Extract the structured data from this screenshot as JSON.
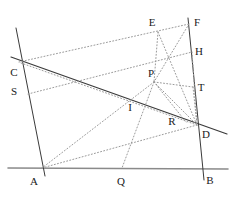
{
  "figure": {
    "width": 230,
    "height": 198,
    "colors": {
      "solid_line": "#3a3a3a",
      "baseline": "#8a8a8a",
      "dotted_line": "#9a9a9a",
      "label": "#1a1a1a",
      "background": "#ffffff"
    },
    "points": [
      {
        "id": "A",
        "label": "A",
        "x": 41,
        "y": 168,
        "label_x": 34,
        "label_y": 181
      },
      {
        "id": "B",
        "label": "B",
        "x": 201,
        "y": 168,
        "label_x": 210,
        "label_y": 180
      },
      {
        "id": "C",
        "label": "C",
        "x": 21,
        "y": 63,
        "label_x": 14,
        "label_y": 72
      },
      {
        "id": "D",
        "label": "D",
        "x": 197,
        "y": 125,
        "label_x": 206,
        "label_y": 134
      },
      {
        "id": "E",
        "label": "E",
        "x": 158,
        "y": 32,
        "label_x": 152,
        "label_y": 22
      },
      {
        "id": "F",
        "label": "F",
        "x": 189,
        "y": 24,
        "label_x": 197,
        "label_y": 22
      },
      {
        "id": "H",
        "label": "H",
        "x": 192,
        "y": 52,
        "label_x": 199,
        "label_y": 51
      },
      {
        "id": "I",
        "label": "I",
        "x": 127,
        "y": 101,
        "label_x": 130,
        "label_y": 107
      },
      {
        "id": "P",
        "label": "P",
        "x": 154,
        "y": 82,
        "label_x": 151,
        "label_y": 73
      },
      {
        "id": "Q",
        "label": "Q",
        "x": 122,
        "y": 168,
        "label_x": 121,
        "label_y": 181
      },
      {
        "id": "R",
        "label": "R",
        "x": 178,
        "y": 115,
        "label_x": 172,
        "label_y": 121
      },
      {
        "id": "S",
        "label": "S",
        "x": 28,
        "y": 94,
        "label_x": 14,
        "label_y": 91
      },
      {
        "id": "T",
        "label": "T",
        "x": 193,
        "y": 87,
        "label_x": 201,
        "label_y": 87
      }
    ],
    "segments": [
      {
        "name": "baseline-AB",
        "from": [
          8,
          168
        ],
        "to": [
          228,
          169
        ],
        "style": "solid-gray",
        "width": 1.6
      },
      {
        "name": "left-line-CA",
        "from": [
          16,
          28
        ],
        "to": [
          45,
          176
        ],
        "style": "solid-dark",
        "width": 1.0
      },
      {
        "name": "right-line-FB",
        "from": [
          188,
          18
        ],
        "to": [
          204,
          180
        ],
        "style": "solid-dark",
        "width": 1.0
      },
      {
        "name": "transversal-CD",
        "from": [
          11,
          57
        ],
        "to": [
          227,
          134
        ],
        "style": "solid-dark",
        "width": 1.2
      },
      {
        "name": "dotted-C-E-F",
        "from": [
          19,
          62
        ],
        "to": [
          189,
          24
        ],
        "style": "dotted",
        "width": 1.0
      },
      {
        "name": "dotted-E-D",
        "from": [
          158,
          32
        ],
        "to": [
          197,
          125
        ],
        "style": "dotted",
        "width": 1.0
      },
      {
        "name": "dotted-E-P",
        "from": [
          158,
          32
        ],
        "to": [
          154,
          82
        ],
        "style": "dotted",
        "width": 1.0
      },
      {
        "name": "dotted-F-P",
        "from": [
          189,
          24
        ],
        "to": [
          154,
          82
        ],
        "style": "dotted",
        "width": 1.0
      },
      {
        "name": "dotted-S-P-H",
        "from": [
          28,
          94
        ],
        "to": [
          192,
          52
        ],
        "style": "dotted",
        "width": 1.0
      },
      {
        "name": "dotted-H-D",
        "from": [
          192,
          52
        ],
        "to": [
          197,
          125
        ],
        "style": "dotted",
        "width": 1.0
      },
      {
        "name": "dotted-P-T",
        "from": [
          154,
          82
        ],
        "to": [
          193,
          87
        ],
        "style": "dotted",
        "width": 1.0
      },
      {
        "name": "dotted-P-D",
        "from": [
          154,
          82
        ],
        "to": [
          197,
          125
        ],
        "style": "dotted",
        "width": 1.0
      },
      {
        "name": "dotted-P-R-D",
        "from": [
          154,
          82
        ],
        "to": [
          186,
          122
        ],
        "style": "dotted",
        "width": 1.0
      },
      {
        "name": "dotted-T-D",
        "from": [
          193,
          87
        ],
        "to": [
          197,
          125
        ],
        "style": "dotted",
        "width": 1.0
      },
      {
        "name": "dotted-P-Q",
        "from": [
          154,
          82
        ],
        "to": [
          122,
          168
        ],
        "style": "dotted",
        "width": 1.0
      },
      {
        "name": "dotted-P-A",
        "from": [
          154,
          82
        ],
        "to": [
          42,
          168
        ],
        "style": "dotted",
        "width": 1.0
      },
      {
        "name": "dotted-A-D",
        "from": [
          42,
          168
        ],
        "to": [
          197,
          125
        ],
        "style": "dotted",
        "width": 1.0
      },
      {
        "name": "dotted-C-D",
        "from": [
          21,
          63
        ],
        "to": [
          197,
          125
        ],
        "style": "dotted",
        "width": 1.0
      }
    ]
  }
}
